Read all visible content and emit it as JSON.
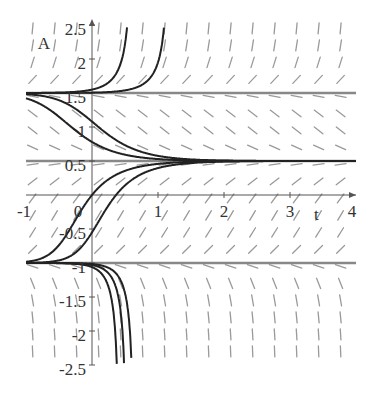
{
  "chart_data": {
    "type": "line",
    "subtype": "slope-field-with-solution-curves",
    "title": "",
    "xlabel": "t",
    "ylabel": "A",
    "xlim": [
      -1,
      4
    ],
    "ylim": [
      -2.5,
      2.5
    ],
    "x_ticks": [
      "-1",
      "0",
      "1",
      "2",
      "3",
      "4"
    ],
    "y_ticks": [
      "2.5",
      "2",
      "1.5",
      "1",
      "0.5",
      "-0.5",
      "-1",
      "-1.5",
      "-2",
      "-2.5"
    ],
    "grid": false,
    "legend": null,
    "equilibria": [
      1.5,
      0.5,
      -1
    ],
    "equation_model": "dA/dt = k (A - 1.5)(A - 0.5)(A + 1)",
    "k": 1.6,
    "series": [
      {
        "name": "solution-1",
        "t0": 0,
        "A0": 1.55
      },
      {
        "name": "solution-2",
        "t0": 0,
        "A0": 1.505
      },
      {
        "name": "solution-3",
        "t0": 0,
        "A0": 1.08
      },
      {
        "name": "solution-4",
        "t0": 0,
        "A0": 0.78
      },
      {
        "name": "solution-5",
        "t0": 0,
        "A0": 0.0
      },
      {
        "name": "solution-6",
        "t0": 0,
        "A0": -0.55
      },
      {
        "name": "solution-7",
        "t0": 0,
        "A0": -1.06
      },
      {
        "name": "solution-8",
        "t0": 0,
        "A0": -1.03
      },
      {
        "name": "solution-9",
        "t0": 0,
        "A0": -1.015
      }
    ],
    "colors": {
      "curve": "#222222",
      "equilibrium": "#888888",
      "slope": "#9a9a9a",
      "axis": "#555555"
    }
  }
}
